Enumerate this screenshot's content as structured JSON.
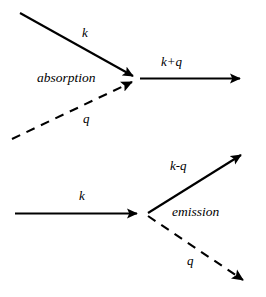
{
  "diagram": {
    "type": "feynman-vertex-diagram",
    "stroke_color": "#000000",
    "background_color": "#ffffff",
    "panels": [
      {
        "id": "absorption",
        "process_label": "absorption",
        "vertex": {
          "x": 137,
          "y": 78
        },
        "lines": [
          {
            "name": "incoming-electron-k",
            "label": "k",
            "style": "solid",
            "from": {
              "x": 20,
              "y": 13
            },
            "to": {
              "x": 137,
              "y": 78
            },
            "arrowhead": "end",
            "label_pos": {
              "x": 85,
              "y": 33
            }
          },
          {
            "name": "incoming-photon-q",
            "label": "q",
            "style": "dashed",
            "from": {
              "x": 12,
              "y": 139
            },
            "to": {
              "x": 137,
              "y": 80
            },
            "arrowhead": "end",
            "label_pos": {
              "x": 86,
              "y": 119
            }
          },
          {
            "name": "outgoing-electron-kplusq",
            "label": "k+q",
            "style": "solid",
            "from": {
              "x": 140,
              "y": 78
            },
            "to": {
              "x": 251,
              "y": 78
            },
            "arrowhead": "end",
            "label_pos": {
              "x": 176,
              "y": 62
            }
          }
        ],
        "process_label_pos": {
          "x": 71,
          "y": 79
        }
      },
      {
        "id": "emission",
        "process_label": "emission",
        "vertex": {
          "x": 148,
          "y": 213
        },
        "lines": [
          {
            "name": "incoming-electron-k",
            "label": "k",
            "style": "solid",
            "from": {
              "x": 15,
              "y": 213
            },
            "to": {
              "x": 148,
              "y": 213
            },
            "arrowhead": "end",
            "label_pos": {
              "x": 82,
              "y": 196
            }
          },
          {
            "name": "outgoing-electron-kminusq",
            "label": "k-q",
            "style": "solid",
            "from": {
              "x": 148,
              "y": 213
            },
            "to": {
              "x": 250,
              "y": 150
            },
            "arrowhead": "end",
            "label_pos": {
              "x": 184,
              "y": 167
            }
          },
          {
            "name": "outgoing-photon-q",
            "label": "q",
            "style": "dashed",
            "from": {
              "x": 148,
              "y": 215
            },
            "to": {
              "x": 253,
              "y": 286
            },
            "arrowhead": "end",
            "label_pos": {
              "x": 190,
              "y": 261
            }
          }
        ],
        "process_label_pos": {
          "x": 200,
          "y": 213
        }
      }
    ]
  },
  "labels": {
    "top_k": "k",
    "top_q": "q",
    "top_kplusq": "k+q",
    "absorption": "absorption",
    "bottom_k": "k",
    "bottom_kminusq": "k-q",
    "bottom_q": "q",
    "emission": "emission"
  }
}
